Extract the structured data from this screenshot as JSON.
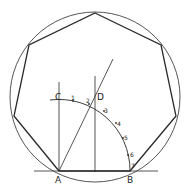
{
  "diagram": {
    "colors": {
      "stroke": "#2a2a2a",
      "background": "#ffffff"
    },
    "circle": {
      "cx": 95,
      "cy": 97,
      "r": 85
    },
    "heptagon_vertices": [
      [
        95,
        13
      ],
      [
        161,
        45
      ],
      [
        176,
        116
      ],
      [
        130,
        171
      ],
      [
        59,
        171
      ],
      [
        14,
        116
      ],
      [
        29,
        45
      ]
    ],
    "points": {
      "A": {
        "label": "A",
        "x": 59,
        "y": 171
      },
      "B": {
        "label": "B",
        "x": 130,
        "y": 171
      },
      "C": {
        "label": "C",
        "x": 59,
        "y": 100
      },
      "D": {
        "label": "D",
        "x": 95,
        "y": 96
      }
    },
    "division_marks": [
      {
        "label": "1",
        "x": 73,
        "y": 101
      },
      {
        "label": "2",
        "x": 89,
        "y": 104
      },
      {
        "label": "3",
        "x": 104,
        "y": 111
      },
      {
        "label": "4",
        "x": 116,
        "y": 123
      },
      {
        "label": "5",
        "x": 123,
        "y": 138
      },
      {
        "label": "6",
        "x": 128,
        "y": 155
      },
      {
        "label": "7",
        "x": 131,
        "y": 168
      }
    ]
  }
}
